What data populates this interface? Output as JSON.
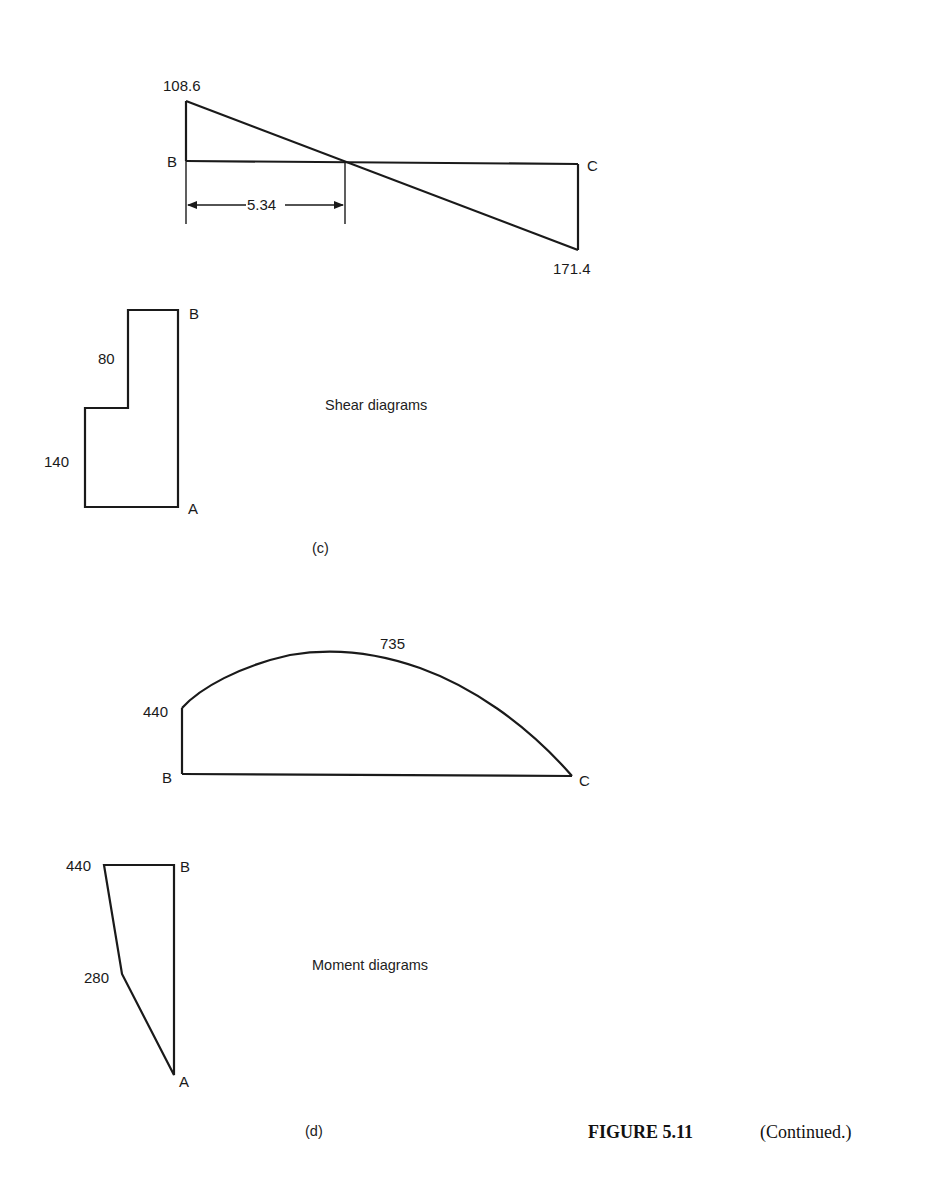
{
  "figure": {
    "number": "FIGURE 5.11",
    "continuation": "(Continued.)"
  },
  "panel_c": {
    "tag": "(c)",
    "title": "Shear diagrams",
    "beam_BC": {
      "left_label": "B",
      "right_label": "C",
      "left_value": "108.6",
      "right_value": "171.4",
      "zero_crossing_dimension": "5.34"
    },
    "column_AB": {
      "top_label": "B",
      "bottom_label": "A",
      "upper_value": "80",
      "lower_value": "140"
    }
  },
  "panel_d": {
    "tag": "(d)",
    "title": "Moment diagrams",
    "beam_BC": {
      "left_label": "B",
      "right_label": "C",
      "left_value": "440",
      "max_value": "735"
    },
    "column_AB": {
      "top_label": "B",
      "bottom_label": "A",
      "top_value": "440",
      "intermediate_value": "280"
    }
  },
  "colors": {
    "line": "#1a1a1a",
    "background": "#ffffff"
  }
}
